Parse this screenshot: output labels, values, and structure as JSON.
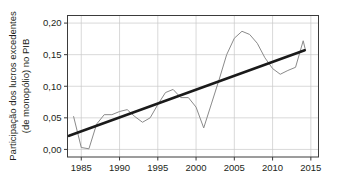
{
  "figure": {
    "background_color": "#ffffff",
    "plot_border_color": "#3b3b3b",
    "grid_color": "#c9c9c9"
  },
  "chart_data": {
    "type": "line",
    "title": "",
    "subtitle": "",
    "xlabel": "",
    "ylabel": "Participação dos lucros excedentes (de monopólio) no PIB",
    "ylabel_line1": "Participação dos lucros excedentes",
    "ylabel_line2": "(de monopólio) no PIB",
    "xlim": [
      1983.2,
      2016.0
    ],
    "ylim": [
      -0.012,
      0.212
    ],
    "grid": true,
    "grid_axes": "both",
    "legend": false,
    "legend_position": "none",
    "x_ticks": [
      1985,
      1990,
      1995,
      2000,
      2005,
      2010,
      2015
    ],
    "x_tick_labels": [
      "1985",
      "1990",
      "1995",
      "2000",
      "2005",
      "2010",
      "2015"
    ],
    "y_ticks": [
      0.0,
      0.05,
      0.1,
      0.15,
      0.2
    ],
    "y_tick_labels": [
      "0,00",
      "0,05",
      "0,10",
      "0,15",
      "0,20"
    ],
    "x": [
      1984,
      1985,
      1986,
      1987,
      1988,
      1989,
      1990,
      1991,
      1992,
      1993,
      1994,
      1995,
      1996,
      1997,
      1998,
      1999,
      2000,
      2001,
      2002,
      2003,
      2004,
      2005,
      2006,
      2007,
      2008,
      2009,
      2010,
      2011,
      2012,
      2013,
      2014
    ],
    "series": [
      {
        "name": "Participação dos lucros excedentes (de monopólio) no PIB",
        "kind": "data-line",
        "color": "#8a8a8a",
        "width": 1.0,
        "values": [
          0.052,
          0.003,
          0.001,
          0.04,
          0.055,
          0.055,
          0.06,
          0.063,
          0.052,
          0.043,
          0.05,
          0.071,
          0.09,
          0.095,
          0.082,
          0.082,
          0.067,
          0.034,
          0.072,
          0.11,
          0.15,
          0.176,
          0.187,
          0.182,
          0.168,
          0.145,
          0.128,
          0.119,
          0.125,
          0.13,
          0.172
        ]
      },
      {
        "name": "Linha de tendência",
        "kind": "trend-line",
        "color": "#1a1a1a",
        "width": 2.6,
        "x_endpoints": [
          1983.4,
          2014.2
        ],
        "y_endpoints": [
          0.0215,
          0.157
        ]
      }
    ],
    "series_tail": {
      "x": [
        2014,
        2014.3
      ],
      "values": [
        0.172,
        0.157
      ]
    }
  }
}
